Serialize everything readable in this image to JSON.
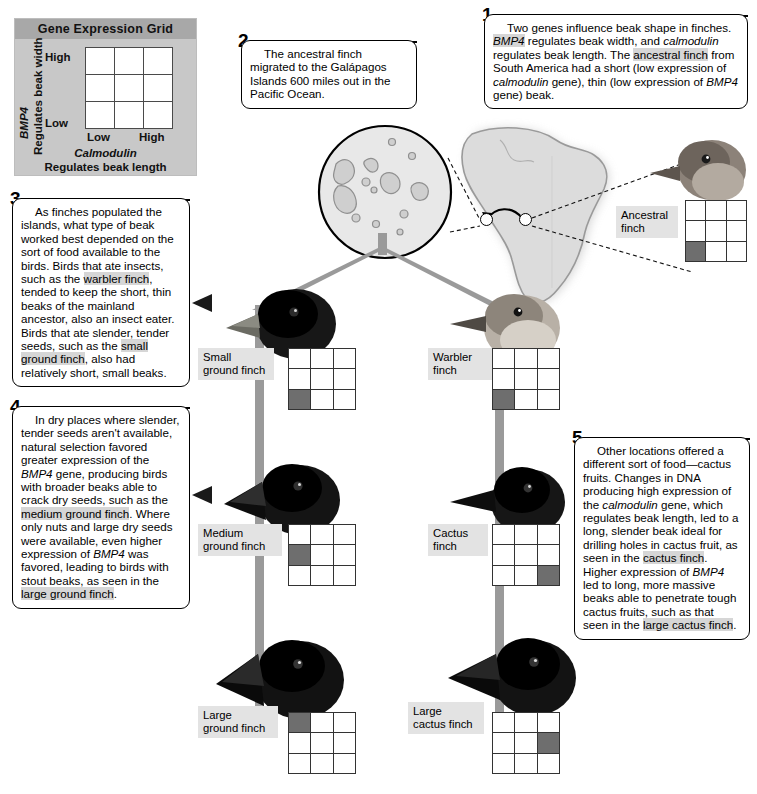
{
  "legend": {
    "title": "Gene Expression Grid",
    "y_gene": "BMP4",
    "y_desc": "Regulates beak width",
    "y_high": "High",
    "y_low": "Low",
    "x_low": "Low",
    "x_high": "High",
    "x_gene": "Calmodulin",
    "x_desc": "Regulates beak length"
  },
  "callouts": [
    {
      "number": "1",
      "text": "Two genes influence beak shape in finches. BMP4 regulates beak width, and calmodulin regulates beak length. The ancestral finch from South America had a short (low expression of calmodulin gene), thin (low expression of BMP4 gene) beak."
    },
    {
      "number": "2",
      "text": "The ancestral finch migrated to the Galápagos Islands 600 miles out in the Pacific Ocean."
    },
    {
      "number": "3",
      "text": "As finches populated the islands, what type of beak worked best depended on the sort of food available to the birds. Birds that ate insects, such as the warbler finch, tended to keep the short, thin beaks of the mainland ancestor, also an insect eater. Birds that ate slender, tender seeds, such as the small ground finch, also had relatively short, small beaks."
    },
    {
      "number": "4",
      "text": "In dry places where slender, tender seeds aren't available, natural selection favored greater expression of the BMP4 gene, producing birds with broader beaks able to crack dry seeds, such as the medium ground finch. Where only nuts and large dry seeds were available, even higher expression of BMP4 was favored, leading to birds with stout beaks, as seen in the large ground finch."
    },
    {
      "number": "5",
      "text": "Other locations offered a different sort of food—cactus fruits. Changes in DNA producing high expression of the calmodulin gene, which regulates beak length, led to a long, slender beak ideal for drilling holes in cactus fruit, as seen in the cactus finch. Higher expression of BMP4 led to long, more massive beaks able to penetrate tough cactus fruits, such as that seen in the large cactus finch."
    }
  ],
  "finches": [
    {
      "id": "ancestral",
      "label": "Ancestral\nfinch",
      "grid_row": 2,
      "grid_col": 0
    },
    {
      "id": "small-ground",
      "label": "Small\nground finch",
      "grid_row": 2,
      "grid_col": 0
    },
    {
      "id": "warbler",
      "label": "Warbler\nfinch",
      "grid_row": 2,
      "grid_col": 0
    },
    {
      "id": "medium-ground",
      "label": "Medium\nground finch",
      "grid_row": 1,
      "grid_col": 0
    },
    {
      "id": "cactus",
      "label": "Cactus\nfinch",
      "grid_row": 2,
      "grid_col": 2
    },
    {
      "id": "large-ground",
      "label": "Large\nground finch",
      "grid_row": 0,
      "grid_col": 0
    },
    {
      "id": "large-cactus",
      "label": "Large\ncactus finch",
      "grid_row": 1,
      "grid_col": 2
    }
  ],
  "colors": {
    "legend_bg": "#c8c8c8",
    "legend_title_bg": "#a8a8a8",
    "branch": "#9a9a9a",
    "grid_on": "#6e6e6e",
    "label_bg": "#e3e3e3",
    "highlight": "#d6d6d6",
    "map_fill": "#dcdcdc",
    "map_stroke": "#9a9a9a"
  }
}
